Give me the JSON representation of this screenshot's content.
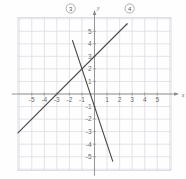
{
  "chart_data": {
    "type": "line",
    "title": "",
    "xlabel": "x",
    "ylabel": "y",
    "xlim": [
      -6.2,
      6.2
    ],
    "ylim": [
      -6.2,
      6.2
    ],
    "grid": true,
    "grid_step": 1,
    "legend": "none",
    "x_ticks": [
      -5,
      -4,
      -3,
      -2,
      -1,
      1,
      2,
      3,
      4,
      5
    ],
    "y_ticks": [
      5,
      4,
      3,
      2,
      1,
      -1,
      -2,
      -3,
      -4,
      -5
    ],
    "x_tick_labels": [
      "-5",
      "-4",
      "-3",
      "-2",
      "-1",
      "1",
      "2",
      "3",
      "4",
      "5"
    ],
    "y_tick_labels": [
      "5",
      "4",
      "3",
      "2",
      "1",
      "-1",
      "-2",
      "-3",
      "-4",
      "-5"
    ],
    "series": [
      {
        "name": "3",
        "label": "3",
        "label_style": "circled",
        "slope": -3,
        "intercept": -1,
        "x": [
          -1.75,
          1.45
        ],
        "y": [
          4.25,
          -5.35
        ],
        "color": "#4a4a4a"
      },
      {
        "name": "4",
        "label": "4",
        "label_style": "circled",
        "slope": 1,
        "intercept": 3,
        "x": [
          -6.1,
          2.6
        ],
        "y": [
          -3.1,
          5.6
        ],
        "color": "#4a4a4a"
      }
    ],
    "intersection": {
      "x": -1,
      "y": 2
    },
    "annotations": [
      {
        "text": "3",
        "kind": "circled-series-label",
        "x": -1.9,
        "y": 6.2
      },
      {
        "text": "4",
        "kind": "circled-series-label",
        "x": 2.8,
        "y": 6.2
      }
    ]
  },
  "axes": {
    "x_axis_label": "x",
    "y_axis_label": "y"
  },
  "colors": {
    "grid": "#d8d8e0",
    "axis": "#8a8a8a",
    "line": "#4a4a4a",
    "text": "#6b6b6b",
    "background": "#fefefe"
  }
}
